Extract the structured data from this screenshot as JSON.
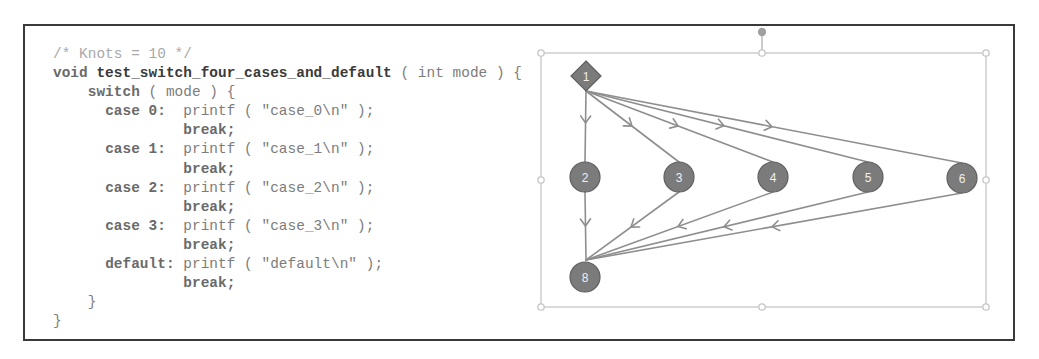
{
  "code": {
    "lines": [
      {
        "indent": "",
        "comment": "/* Knots = 10 */"
      },
      {
        "indent": "",
        "kw": "void ",
        "fn": "test_switch_four_cases_and_default",
        "txt": " ( int mode ) {"
      },
      {
        "indent": "    ",
        "kw": "switch",
        "txt": " ( mode ) {"
      },
      {
        "indent": "      ",
        "kw": "case 0:",
        "txt": "  printf ( \"case_0\\n\" );"
      },
      {
        "indent": "               ",
        "kw": "break;",
        "txt": ""
      },
      {
        "indent": "      ",
        "kw": "case 1:",
        "txt": "  printf ( \"case_1\\n\" );"
      },
      {
        "indent": "               ",
        "kw": "break;",
        "txt": ""
      },
      {
        "indent": "      ",
        "kw": "case 2:",
        "txt": "  printf ( \"case_2\\n\" );"
      },
      {
        "indent": "               ",
        "kw": "break;",
        "txt": ""
      },
      {
        "indent": "      ",
        "kw": "case 3:",
        "txt": "  printf ( \"case_3\\n\" );"
      },
      {
        "indent": "               ",
        "kw": "break;",
        "txt": ""
      },
      {
        "indent": "      ",
        "kw": "default:",
        "txt": " printf ( \"default\\n\" );"
      },
      {
        "indent": "               ",
        "kw": "break;",
        "txt": ""
      },
      {
        "indent": "    ",
        "kw": "",
        "txt": "}"
      },
      {
        "indent": "",
        "kw": "",
        "txt": "}"
      }
    ]
  },
  "graph": {
    "nodes": [
      {
        "id": "1",
        "label": "1",
        "shape": "diamond",
        "x": 586,
        "y": 76
      },
      {
        "id": "2",
        "label": "2",
        "shape": "circle",
        "x": 585,
        "y": 177
      },
      {
        "id": "3",
        "label": "3",
        "shape": "circle",
        "x": 679,
        "y": 177
      },
      {
        "id": "4",
        "label": "4",
        "shape": "circle",
        "x": 773,
        "y": 177
      },
      {
        "id": "5",
        "label": "5",
        "shape": "circle",
        "x": 868,
        "y": 177
      },
      {
        "id": "6",
        "label": "6",
        "shape": "circle",
        "x": 962,
        "y": 178
      },
      {
        "id": "8",
        "label": "8",
        "shape": "circle",
        "x": 585,
        "y": 277
      }
    ],
    "edges": [
      {
        "from": "1",
        "to": "2"
      },
      {
        "from": "1",
        "to": "3"
      },
      {
        "from": "1",
        "to": "4"
      },
      {
        "from": "1",
        "to": "5"
      },
      {
        "from": "1",
        "to": "6"
      },
      {
        "from": "2",
        "to": "8"
      },
      {
        "from": "3",
        "to": "8"
      },
      {
        "from": "4",
        "to": "8"
      },
      {
        "from": "5",
        "to": "8"
      },
      {
        "from": "6",
        "to": "8"
      }
    ],
    "colors": {
      "node_fill": "#7b7b7b",
      "node_stroke": "#5e5e5e",
      "edge": "#8e8e8e",
      "selection": "#c8c8c8"
    }
  }
}
